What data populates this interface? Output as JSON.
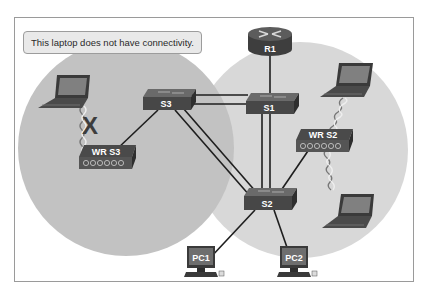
{
  "callout": {
    "text": "This laptop does not have connectivity."
  },
  "devices": {
    "router": {
      "label": "R1",
      "type": "router"
    },
    "switches": [
      {
        "label": "S1",
        "type": "switch"
      },
      {
        "label": "S2",
        "type": "switch"
      },
      {
        "label": "S3",
        "type": "switch"
      }
    ],
    "wireless_routers": [
      {
        "label": "WR S3",
        "type": "wireless-router"
      },
      {
        "label": "WR S2",
        "type": "wireless-router"
      }
    ],
    "pcs": [
      {
        "label": "PC1",
        "type": "pc"
      },
      {
        "label": "PC2",
        "type": "pc"
      }
    ],
    "laptops": [
      {
        "name": "laptop-wr-s3",
        "status": "no connectivity"
      },
      {
        "name": "laptop-wr-s2-top",
        "status": "connected"
      },
      {
        "name": "laptop-wr-s2-bottom",
        "status": "connected"
      }
    ]
  },
  "links": [
    {
      "from": "R1",
      "to": "S1",
      "kind": "wired"
    },
    {
      "from": "S3",
      "to": "S1",
      "kind": "wired-double"
    },
    {
      "from": "S3",
      "to": "S2",
      "kind": "wired-double"
    },
    {
      "from": "S1",
      "to": "S2",
      "kind": "wired-double"
    },
    {
      "from": "S3",
      "to": "WR S3",
      "kind": "wired"
    },
    {
      "from": "S2",
      "to": "WR S2",
      "kind": "wired"
    },
    {
      "from": "S2",
      "to": "PC1",
      "kind": "wired"
    },
    {
      "from": "S2",
      "to": "PC2",
      "kind": "wired"
    },
    {
      "from": "WR S3",
      "to": "laptop-wr-s3",
      "kind": "wireless-broken"
    },
    {
      "from": "WR S2",
      "to": "laptop-wr-s2-top",
      "kind": "wireless"
    },
    {
      "from": "WR S2",
      "to": "laptop-wr-s2-bottom",
      "kind": "wireless"
    }
  ],
  "markers": {
    "broken_link_symbol": "X"
  },
  "colors": {
    "device_fill": "#4a4a4a",
    "device_top": "#6a6a6a",
    "circle_left": "#c3c3c3",
    "circle_right": "#d6d6d6",
    "frame_border": "#9a9a9a",
    "callout_bg": "#e9e9e9"
  }
}
